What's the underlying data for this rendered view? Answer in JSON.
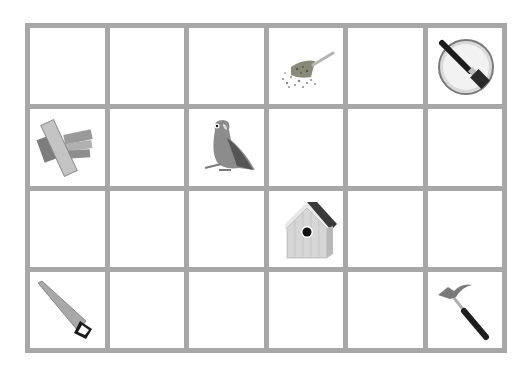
{
  "board": {
    "rows": 4,
    "cols": 6,
    "grid_color": "#a7a7a7",
    "cell_color": "#ffffff",
    "cells": [
      {
        "row": 1,
        "col": 1,
        "item": null
      },
      {
        "row": 1,
        "col": 2,
        "item": null
      },
      {
        "row": 1,
        "col": 3,
        "item": null
      },
      {
        "row": 1,
        "col": 4,
        "item": "seed-scoop"
      },
      {
        "row": 1,
        "col": 5,
        "item": null
      },
      {
        "row": 1,
        "col": 6,
        "item": "paint-can-brush"
      },
      {
        "row": 2,
        "col": 1,
        "item": "wood-planks"
      },
      {
        "row": 2,
        "col": 2,
        "item": null
      },
      {
        "row": 2,
        "col": 3,
        "item": "parrot"
      },
      {
        "row": 2,
        "col": 4,
        "item": null
      },
      {
        "row": 2,
        "col": 5,
        "item": null
      },
      {
        "row": 2,
        "col": 6,
        "item": null
      },
      {
        "row": 3,
        "col": 1,
        "item": null
      },
      {
        "row": 3,
        "col": 2,
        "item": null
      },
      {
        "row": 3,
        "col": 3,
        "item": null
      },
      {
        "row": 3,
        "col": 4,
        "item": "birdhouse"
      },
      {
        "row": 3,
        "col": 5,
        "item": null
      },
      {
        "row": 3,
        "col": 6,
        "item": null
      },
      {
        "row": 4,
        "col": 1,
        "item": "hand-saw"
      },
      {
        "row": 4,
        "col": 2,
        "item": null
      },
      {
        "row": 4,
        "col": 3,
        "item": null
      },
      {
        "row": 4,
        "col": 4,
        "item": null
      },
      {
        "row": 4,
        "col": 5,
        "item": null
      },
      {
        "row": 4,
        "col": 6,
        "item": "hammer"
      }
    ]
  }
}
